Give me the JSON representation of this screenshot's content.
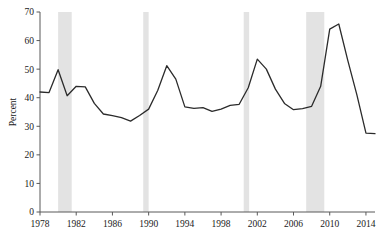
{
  "chart_data": {
    "type": "line",
    "title": "",
    "xlabel": "",
    "ylabel": "Percent",
    "xlim": [
      1978,
      2015
    ],
    "ylim": [
      0,
      70
    ],
    "grid": false,
    "legend": "none",
    "xticks": [
      1978,
      1982,
      1986,
      1990,
      1994,
      1998,
      2002,
      2006,
      2010,
      2014
    ],
    "yticks": [
      0,
      10,
      20,
      30,
      40,
      50,
      60,
      70
    ],
    "line_color": "#2b2b2b",
    "shade_color": "#e3e3e3",
    "axis_color": "#595959",
    "shaded_regions": [
      {
        "label": "recession-1980",
        "start": 1980.0,
        "end": 1981.5
      },
      {
        "label": "recession-1990",
        "start": 1989.4,
        "end": 1990.0
      },
      {
        "label": "recession-2001",
        "start": 2000.5,
        "end": 2001.1
      },
      {
        "label": "recession-2008",
        "start": 2007.4,
        "end": 2009.4
      }
    ],
    "x": [
      1978,
      1979,
      1980,
      1981,
      1982,
      1983,
      1984,
      1985,
      1986,
      1987,
      1988,
      1989,
      1990,
      1991,
      1992,
      1993,
      1994,
      1995,
      1996,
      1997,
      1998,
      1999,
      2000,
      2001,
      2002,
      2003,
      2004,
      2005,
      2006,
      2007,
      2008,
      2009,
      2010,
      2011,
      2012,
      2013,
      2014,
      2015
    ],
    "values": [
      42.0,
      41.8,
      49.8,
      40.7,
      44.0,
      43.8,
      38.0,
      34.3,
      33.7,
      33.0,
      31.8,
      33.8,
      36.0,
      42.5,
      51.2,
      46.5,
      36.8,
      36.3,
      36.5,
      35.2,
      36.0,
      37.3,
      37.7,
      43.5,
      53.5,
      50.0,
      43.0,
      38.0,
      35.8,
      36.2,
      37.0,
      44.0,
      64.0,
      65.8,
      53.0,
      41.0,
      27.6,
      27.4
    ],
    "series_name": "Percent"
  }
}
